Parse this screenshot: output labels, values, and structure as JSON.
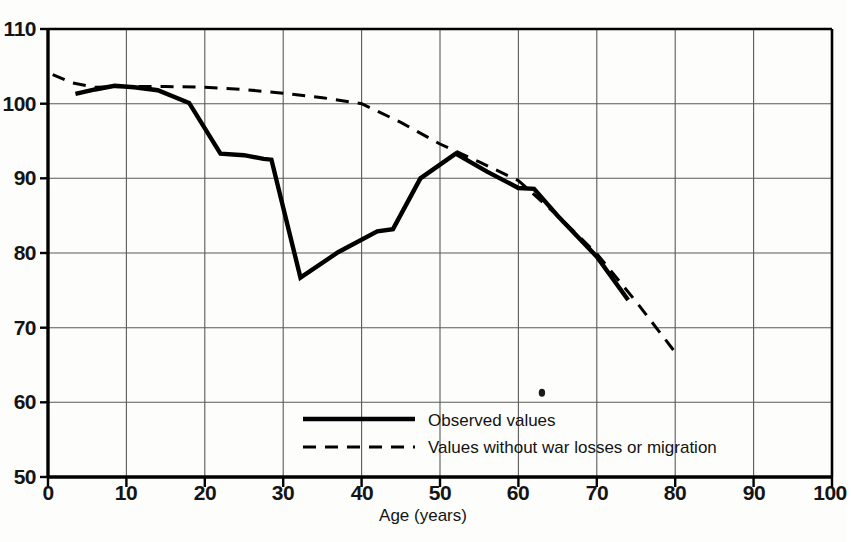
{
  "chart_data": {
    "type": "line",
    "title": "",
    "subtitle": "",
    "xlabel": "Age (years)",
    "ylabel": "",
    "xlim": [
      0,
      100
    ],
    "ylim": [
      50,
      110
    ],
    "xticks": [
      0,
      10,
      20,
      30,
      40,
      50,
      60,
      70,
      80,
      90,
      100
    ],
    "yticks": [
      50,
      60,
      70,
      80,
      90,
      100,
      110
    ],
    "grid": true,
    "legend_position": "bottom-center",
    "series": [
      {
        "name": "Observed values",
        "style": "solid",
        "color": "#000000",
        "x": [
          3.5,
          6,
          8.5,
          11,
          14,
          18,
          22,
          25,
          27.5,
          28.5,
          32.2,
          37,
          42,
          44,
          47.5,
          52,
          56,
          60,
          62,
          65,
          70,
          74
        ],
        "y": [
          101.3,
          101.9,
          102.4,
          102.2,
          101.8,
          100.1,
          93.3,
          93.1,
          92.6,
          92.5,
          76.7,
          80.1,
          82.9,
          83.2,
          90.0,
          93.3,
          90.9,
          88.7,
          88.6,
          85.0,
          79.5,
          73.7
        ]
      },
      {
        "name": "Values without war losses or migration",
        "style": "dashed",
        "color": "#000000",
        "x": [
          0.6,
          3,
          6,
          10,
          15,
          20,
          25,
          30,
          35,
          40,
          45,
          50,
          55,
          60,
          65,
          70,
          75,
          80
        ],
        "y": [
          103.9,
          102.8,
          102.2,
          102.3,
          102.3,
          102.2,
          101.9,
          101.4,
          100.8,
          100.0,
          97.5,
          94.6,
          92.2,
          89.7,
          85.0,
          79.9,
          73.5,
          66.7
        ]
      }
    ],
    "annotations": [
      {
        "name": "ink-speck",
        "x": 63,
        "y": 61.3
      }
    ]
  },
  "axis": {
    "y_tick_labels": [
      "110",
      "100",
      "90",
      "80",
      "70",
      "60",
      "50"
    ],
    "x_tick_labels": [
      "0",
      "10",
      "20",
      "30",
      "40",
      "50",
      "60",
      "70",
      "80",
      "90",
      "100"
    ],
    "x_title": "Age (years)"
  },
  "legend": {
    "observed_label": "Observed values",
    "nowar_label": "Values without war losses or migration"
  },
  "colors": {
    "line": "#000000",
    "grid": "#5a5a5a",
    "frame": "#000000",
    "background": "#fdfdfc"
  }
}
